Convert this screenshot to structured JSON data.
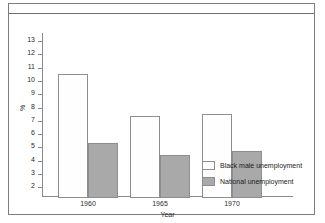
{
  "figure": {
    "caption": "",
    "border_color": "#7d7d7d"
  },
  "chart_data": {
    "type": "bar",
    "title": "",
    "categories": [
      "1960",
      "1965",
      "1970"
    ],
    "series": [
      {
        "name": "Black male unemployment",
        "values": [
          10.7,
          7.5,
          7.7
        ],
        "color": "#ffffff"
      },
      {
        "name": "National unemployment",
        "values": [
          5.5,
          4.6,
          4.9
        ],
        "color": "#a9a9a9"
      }
    ],
    "xlabel": "Year",
    "ylabel": "%",
    "ylim": [
      1.35,
      13.6
    ],
    "yticks": [
      13,
      12,
      11,
      10,
      9,
      8,
      7,
      6,
      5,
      4,
      3,
      2
    ],
    "grid": false,
    "legend_position": "bottom-right"
  },
  "legend": {
    "entries": [
      {
        "label": "Black male unemployment"
      },
      {
        "label": "National unemployment"
      }
    ]
  }
}
